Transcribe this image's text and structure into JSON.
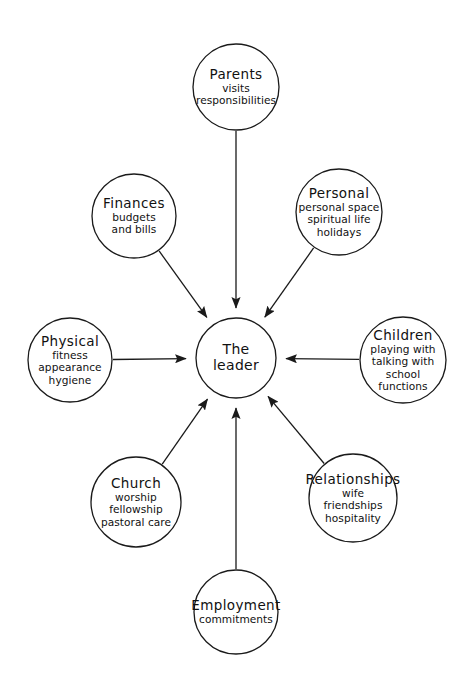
{
  "diagram": {
    "type": "radial-spoke",
    "title_visible": "",
    "style": {
      "background_color": "#ffffff",
      "stroke_color": "#1a1a1a",
      "text_color": "#111111",
      "stroke_width": 1.3
    },
    "center": {
      "id": "the-leader",
      "lines": [
        "The",
        "leader"
      ],
      "title": "The leader",
      "cx": 236,
      "cy": 358,
      "r": 40
    },
    "nodes": [
      {
        "id": "parents",
        "title": "Parents",
        "details": [
          "visits",
          "responsibilities"
        ],
        "cx": 236,
        "cy": 87,
        "r": 43,
        "arrow_direction": "to-center"
      },
      {
        "id": "finances",
        "title": "Finances",
        "details": [
          "budgets",
          "and bills"
        ],
        "cx": 134,
        "cy": 216,
        "r": 42,
        "arrow_direction": "to-center"
      },
      {
        "id": "personal",
        "title": "Personal",
        "details": [
          "personal space",
          "spiritual life",
          "holidays"
        ],
        "cx": 339,
        "cy": 212,
        "r": 43,
        "arrow_direction": "to-center"
      },
      {
        "id": "physical",
        "title": "Physical",
        "details": [
          "fitness",
          "appearance",
          "hygiene"
        ],
        "cx": 70,
        "cy": 360,
        "r": 42,
        "arrow_direction": "to-center"
      },
      {
        "id": "children",
        "title": "Children",
        "details": [
          "playing with",
          "talking with",
          "school",
          "functions"
        ],
        "cx": 403,
        "cy": 360,
        "r": 43,
        "arrow_direction": "to-center"
      },
      {
        "id": "church",
        "title": "Church",
        "details": [
          "worship",
          "fellowship",
          "pastoral care"
        ],
        "cx": 136,
        "cy": 502,
        "r": 45,
        "arrow_direction": "to-center"
      },
      {
        "id": "relationships",
        "title": "Relationships",
        "details": [
          "wife",
          "friendships",
          "hospitality"
        ],
        "cx": 353,
        "cy": 498,
        "r": 44,
        "arrow_direction": "to-center"
      },
      {
        "id": "employment",
        "title": "Employment",
        "details": [
          "commitments"
        ],
        "cx": 236,
        "cy": 612,
        "r": 42,
        "arrow_direction": "to-center"
      }
    ]
  }
}
